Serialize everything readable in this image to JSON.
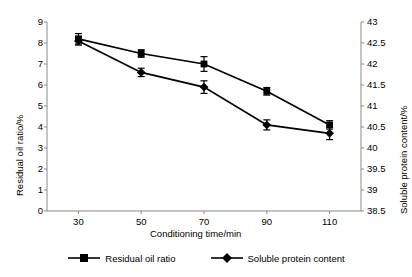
{
  "chart_data": {
    "type": "line",
    "title": "",
    "xlabel": "Conditioning time/min",
    "ylabel": "Residual oil ratio/%",
    "ylabel_secondary": "Soluble protein content/%",
    "categories": [
      "30",
      "50",
      "70",
      "90",
      "110"
    ],
    "x": [
      30,
      50,
      70,
      90,
      110
    ],
    "xlim": [
      20,
      120
    ],
    "xticks": [
      "30",
      "50",
      "70",
      "90",
      "110"
    ],
    "ylim": [
      0,
      9
    ],
    "yticks": [
      "0",
      "1",
      "2",
      "3",
      "4",
      "5",
      "6",
      "7",
      "8",
      "9"
    ],
    "ylim_secondary": [
      38.5,
      43
    ],
    "yticks_secondary": [
      "38.5",
      "39",
      "39.5",
      "40",
      "40.5",
      "41",
      "41.5",
      "42",
      "42.5",
      "43"
    ],
    "grid": false,
    "legend_position": "bottom",
    "series": [
      {
        "name": "Residual oil ratio",
        "axis": "left",
        "marker": "square",
        "color": "#000000",
        "values": [
          8.2,
          7.5,
          7.0,
          5.7,
          4.1
        ],
        "errors": [
          0.25,
          0.18,
          0.35,
          0.18,
          0.2
        ]
      },
      {
        "name": "Soluble protein content",
        "axis": "right",
        "marker": "diamond",
        "color": "#000000",
        "values": [
          42.55,
          41.8,
          41.45,
          40.55,
          40.35
        ],
        "errors": [
          0.1,
          0.1,
          0.15,
          0.12,
          0.15
        ]
      }
    ]
  },
  "legend": {
    "items": [
      {
        "label": "Residual oil ratio",
        "marker": "square"
      },
      {
        "label": "Soluble protein content",
        "marker": "diamond"
      }
    ]
  },
  "axes": {
    "left_title": "Residual oil ratio/%",
    "right_title": "Soluble protein content/%",
    "bottom_title": "Conditioning time/min"
  }
}
